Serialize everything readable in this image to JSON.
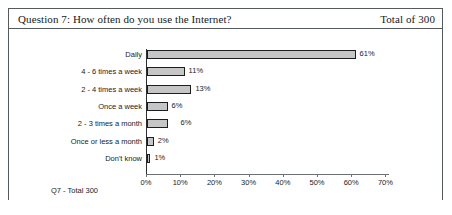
{
  "header": {
    "title": "Question 7: How often do you use the Internet?",
    "total": "Total of 300"
  },
  "footer": {
    "label": "Q7 - Total 300"
  },
  "chart_data": {
    "type": "bar",
    "orientation": "horizontal",
    "title": "Question 7: How often do you use the Internet?",
    "xlabel": "",
    "ylabel": "",
    "xlim": [
      0,
      70
    ],
    "grid": false,
    "legend": false,
    "categories": [
      "Daily",
      "4 - 6 times a week",
      "2 - 4 times a week",
      "Once a week",
      "2 - 3 times a month",
      "Once or less a month",
      "Don't know"
    ],
    "values": [
      61,
      11,
      13,
      6,
      6,
      2,
      1
    ],
    "data_labels": [
      "61%",
      "11%",
      "13%",
      "6%",
      "6%",
      "2%",
      "1%"
    ],
    "xticks": [
      0,
      10,
      20,
      30,
      40,
      50,
      60,
      70
    ],
    "xtick_labels": [
      "0%",
      "10%",
      "20%",
      "30%",
      "40%",
      "50%",
      "60%",
      "70%"
    ],
    "bar_color": "#c6c6c6",
    "bar_border_color": "#1c1e20"
  }
}
